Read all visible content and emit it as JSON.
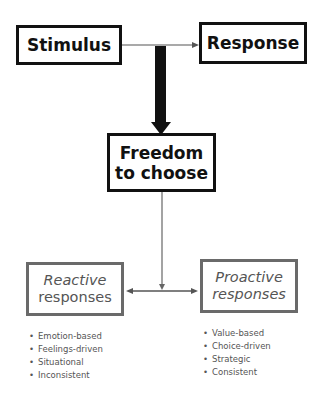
{
  "diagram": {
    "nodes": {
      "stimulus": {
        "label": "Stimulus"
      },
      "response": {
        "label": "Response"
      },
      "freedom": {
        "line1": "Freedom",
        "line2": "to choose"
      },
      "reactive": {
        "line1": "Reactive",
        "line2": "responses"
      },
      "proactive": {
        "line1": "Proactive",
        "line2": "responses"
      }
    },
    "reactive_traits": [
      "Emotion-based",
      "Feelings-driven",
      "Situational",
      "Inconsistent"
    ],
    "proactive_traits": [
      "Value-based",
      "Choice-driven",
      "Strategic",
      "Consistent"
    ],
    "colors": {
      "dark": "#111111",
      "grey": "#6a6a6a",
      "text_grey": "#555555"
    }
  }
}
